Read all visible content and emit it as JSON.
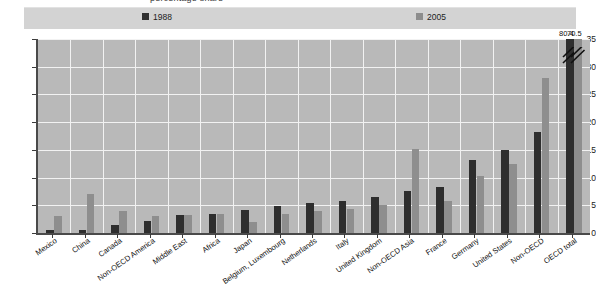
{
  "title": {
    "text": "percentage share"
  },
  "legend": {
    "position": "top",
    "items": [
      {
        "label": "1988",
        "color": "#2e2e2e",
        "icon": "square-marker-icon"
      },
      {
        "label": "2005",
        "color": "#8e8e8e",
        "icon": "square-marker-icon"
      }
    ]
  },
  "axes": {
    "y_ticks": [
      "35",
      "30",
      "25",
      "20",
      "15",
      "10",
      "5",
      "0"
    ],
    "ylabel": "",
    "xlabel": ""
  },
  "annotations": [
    {
      "text": "80.4",
      "series": "1988",
      "category": "OECD total"
    },
    {
      "text": "70.5",
      "series": "2005",
      "category": "OECD total"
    }
  ],
  "chart_data": {
    "type": "bar",
    "title": "percentage share",
    "xlabel": "",
    "ylabel": "",
    "ylim": [
      0,
      35
    ],
    "yticks": [
      0,
      5,
      10,
      15,
      20,
      25,
      30,
      35
    ],
    "grid": true,
    "legend_position": "top",
    "note": "OECD total bars exceed the axis range and are drawn broken with slash marks; their true values are labelled above the bars.",
    "categories": [
      "Mexico",
      "China",
      "Canada",
      "Non-OECD America",
      "Middle East",
      "Africa",
      "Japan",
      "Belgium, Luxembourg",
      "Netherlands",
      "Italy",
      "United Kingdom",
      "Non-OECD Asia",
      "France",
      "Germany",
      "United States",
      "Non-OECD",
      "OECD total"
    ],
    "series": [
      {
        "name": "1988",
        "color": "#2e2e2e",
        "values": [
          0.5,
          0.6,
          1.5,
          2.2,
          3.2,
          3.5,
          4.2,
          4.9,
          5.5,
          5.7,
          6.5,
          7.5,
          8.3,
          13.2,
          15.0,
          18.2,
          80.4
        ]
      },
      {
        "name": "2005",
        "color": "#8e8e8e",
        "values": [
          3.0,
          7.0,
          4.0,
          3.0,
          3.2,
          3.5,
          2.0,
          3.4,
          4.0,
          4.3,
          5.0,
          15.2,
          5.7,
          10.2,
          12.4,
          28.0,
          70.5
        ]
      }
    ]
  }
}
